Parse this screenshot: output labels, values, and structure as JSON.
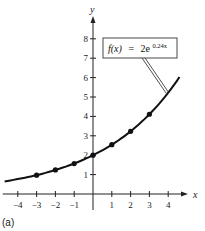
{
  "panel_label": "(a)",
  "chart_data": {
    "type": "line",
    "title": "",
    "function_label": {
      "lhs": "f(x)",
      "eq": "=",
      "base": "2e",
      "exponent": "0.24x"
    },
    "xlabel": "x",
    "ylabel": "y",
    "xlim": [
      -4.8,
      4.9
    ],
    "ylim": [
      0,
      8.7
    ],
    "x_ticks": [
      -4,
      -3,
      -2,
      -1,
      1,
      2,
      3,
      4
    ],
    "x_tick_labels": [
      "−4",
      "−3",
      "−2",
      "−1",
      "1",
      "2",
      "3",
      "4"
    ],
    "y_ticks": [
      1,
      2,
      3,
      4,
      5,
      6,
      7,
      8
    ],
    "y_tick_labels": [
      "1",
      "2",
      "3",
      "4",
      "5",
      "6",
      "7",
      "8"
    ],
    "grid": false,
    "series": [
      {
        "name": "f(x) = 2e^(0.24x)",
        "curve_x": [
          -4.7,
          -4,
          -3,
          -2,
          -1,
          0,
          1,
          2,
          3,
          4,
          4.6
        ],
        "curve_y": [
          0.65,
          0.77,
          0.97,
          1.24,
          1.57,
          2.0,
          2.54,
          3.23,
          4.11,
          5.22,
          6.03
        ],
        "marked_points": {
          "x": [
            -3,
            -2,
            -1,
            0,
            1,
            2,
            3
          ],
          "y": [
            0.97,
            1.24,
            1.57,
            2.0,
            2.54,
            3.23,
            4.11
          ]
        }
      }
    ]
  }
}
